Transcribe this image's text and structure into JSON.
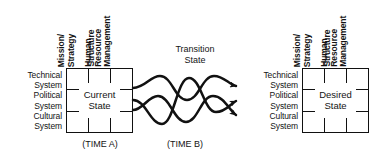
{
  "diagram": {
    "background_color": "#ffffff",
    "line_color": "#111111",
    "text_color": "#141414"
  },
  "row_labels": [
    {
      "line1": "Technical",
      "line2": "System"
    },
    {
      "line1": "Political",
      "line2": "System"
    },
    {
      "line1": "Cultural",
      "line2": "System"
    }
  ],
  "column_labels": [
    {
      "line1": "Mission/",
      "line2": "Strategy"
    },
    {
      "line1": "Structure",
      "line2": ""
    },
    {
      "line1": "Human",
      "line2": "Resource",
      "line3": "Management"
    }
  ],
  "left_box": {
    "caption_line1": "Current",
    "caption_line2": "State",
    "time_label": "(TIME A)"
  },
  "right_box": {
    "caption_line1": "Desired",
    "caption_line2": "State",
    "time_label": ""
  },
  "middle": {
    "label_line1": "Transition",
    "label_line2": "State",
    "time_label": "(TIME B)",
    "strand_count": 3,
    "arrow_count": 3
  }
}
